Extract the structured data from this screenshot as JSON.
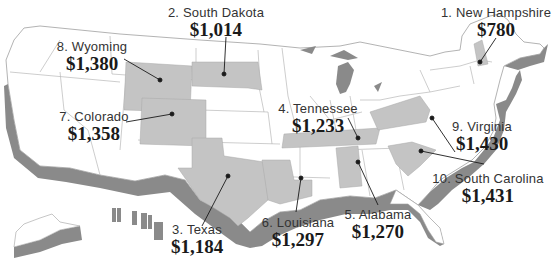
{
  "map": {
    "type": "us-state-ranking-map",
    "colors": {
      "land": "#ffffff",
      "border": "#b8b8b8",
      "outline": "#a0a0a0",
      "highlighted_state": "#c4c4c4",
      "extrusion_shadow": "#8a8a8a",
      "leader_line": "#1a1a1a",
      "text": "#222222"
    },
    "rankings": [
      {
        "rank": "1",
        "name": "1. New Hampshire",
        "value": "$780"
      },
      {
        "rank": "2",
        "name": "2. South Dakota",
        "value": "$1,014"
      },
      {
        "rank": "3",
        "name": "3. Texas",
        "value": "$1,184"
      },
      {
        "rank": "4",
        "name": "4. Tennessee",
        "value": "$1,233"
      },
      {
        "rank": "5",
        "name": "5. Alabama",
        "value": "$1,270"
      },
      {
        "rank": "6",
        "name": "6. Louisiana",
        "value": "$1,297"
      },
      {
        "rank": "7",
        "name": "7. Colorado",
        "value": "$1,358"
      },
      {
        "rank": "8",
        "name": "8. Wyoming",
        "value": "$1,380"
      },
      {
        "rank": "9",
        "name": "9. Virginia",
        "value": "$1,430"
      },
      {
        "rank": "10",
        "name": "10. South Carolina",
        "value": "$1,431"
      }
    ]
  }
}
